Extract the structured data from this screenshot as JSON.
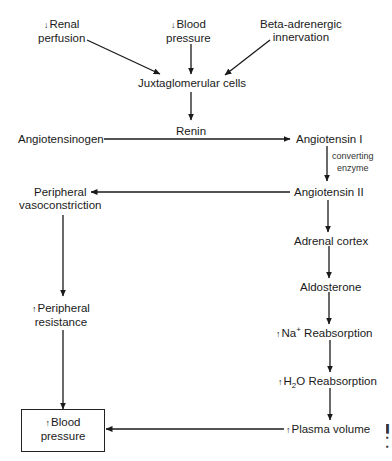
{
  "diagram": {
    "nodes": {
      "renal_perfusion": {
        "arrow": "↓",
        "line1": "Renal",
        "line2": "perfusion"
      },
      "blood_pressure_in": {
        "arrow": "↓",
        "line1": "Blood",
        "line2": "pressure"
      },
      "beta_adrenergic": {
        "line1": "Beta-adrenergic",
        "line2": "innervation"
      },
      "juxtaglomerular": {
        "label": "Juxtaglomerular cells"
      },
      "renin": {
        "label": "Renin"
      },
      "angiotensinogen": {
        "label": "Angiotensinogen"
      },
      "angiotensin_1": {
        "label": "Angiotensin I"
      },
      "converting_enzyme": {
        "line1": "converting",
        "line2": "enzyme"
      },
      "angiotensin_2": {
        "label": "Angiotensin II"
      },
      "peripheral_vasoconstriction": {
        "line1": "Peripheral",
        "line2": "vasoconstriction"
      },
      "adrenal_cortex": {
        "label": "Adrenal cortex"
      },
      "aldosterone": {
        "label": "Aldosterone"
      },
      "peripheral_resistance": {
        "arrow": "↑",
        "line1": "Peripheral",
        "line2": "resistance"
      },
      "na_reabsorption": {
        "arrow": "↑",
        "pre": "Na",
        "sup": "+",
        "post": " Reabsorption"
      },
      "h2o_reabsorption": {
        "arrow": "↑",
        "pre": "H",
        "sub": "2",
        "post": "O Reabsorption"
      },
      "plasma_volume": {
        "arrow": "↑",
        "label": "Plasma volume"
      },
      "blood_pressure_out": {
        "arrow": "↑",
        "line1": "Blood",
        "line2": "pressure"
      }
    },
    "edges": [
      [
        "Renal perfusion",
        "Juxtaglomerular cells"
      ],
      [
        "Blood pressure",
        "Juxtaglomerular cells"
      ],
      [
        "Beta-adrenergic innervation",
        "Juxtaglomerular cells"
      ],
      [
        "Juxtaglomerular cells",
        "Renin"
      ],
      [
        "Angiotensinogen",
        "Angiotensin I"
      ],
      [
        "Angiotensin I",
        "Angiotensin II"
      ],
      [
        "Angiotensin II",
        "Peripheral vasoconstriction"
      ],
      [
        "Angiotensin II",
        "Adrenal cortex"
      ],
      [
        "Peripheral vasoconstriction",
        "Peripheral resistance"
      ],
      [
        "Peripheral resistance",
        "Blood pressure"
      ],
      [
        "Adrenal cortex",
        "Aldosterone"
      ],
      [
        "Aldosterone",
        "Na+ Reabsorption"
      ],
      [
        "Na+ Reabsorption",
        "H2O Reabsorption"
      ],
      [
        "H2O Reabsorption",
        "Plasma volume"
      ],
      [
        "Plasma volume",
        "Blood pressure"
      ]
    ],
    "colors": {
      "ink": "#1a1a1a",
      "background": "#ffffff"
    }
  }
}
